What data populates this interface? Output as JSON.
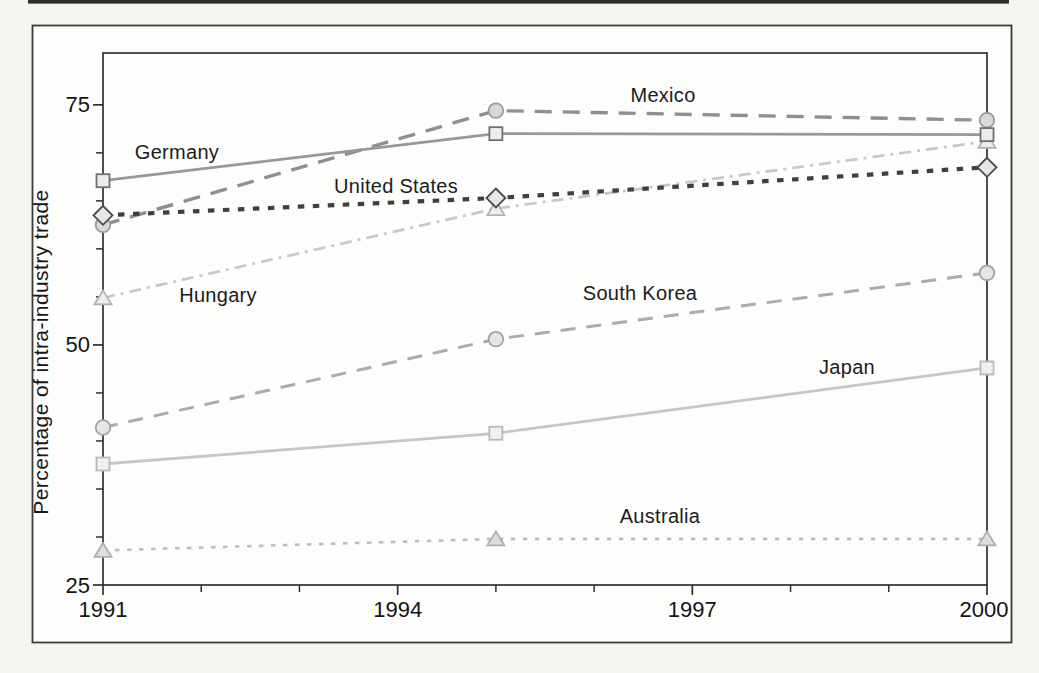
{
  "figure": {
    "page_background": "#f4f4f1",
    "paper_color": "#fdfdfc",
    "border_color": "#3b3b3b",
    "top_rule_color": "#2e2e2e"
  },
  "chart_data": {
    "type": "line",
    "title": "",
    "xlabel": "",
    "ylabel": "Percentage of intra-industry trade",
    "x": [
      1991,
      1995,
      2000
    ],
    "xlim": [
      1991,
      2000
    ],
    "ylim": [
      25,
      80.4
    ],
    "x_major_ticks": [
      1991,
      1994,
      1997,
      2000
    ],
    "x_minor_ticks": [
      1992,
      1993,
      1995,
      1996,
      1998,
      1999
    ],
    "y_major_ticks": [
      25,
      50,
      75
    ],
    "y_minor_ticks": [
      30,
      35,
      40,
      45,
      55,
      60,
      65,
      70
    ],
    "grid": false,
    "legend": "inline-series-labels",
    "series": [
      {
        "name": "Mexico",
        "values": [
          62.5,
          74.4,
          73.4
        ],
        "line": {
          "style": "dashed",
          "color": "#8f8f8f",
          "width": 3.4,
          "dash": "17 11"
        },
        "marker": {
          "shape": "circle",
          "fill": "#d9d9d9",
          "stroke": "#9a9a9a"
        },
        "label_pos": {
          "x": 663,
          "y": 102
        }
      },
      {
        "name": "Germany",
        "values": [
          67.1,
          72.0,
          71.9
        ],
        "line": {
          "style": "solid",
          "color": "#989898",
          "width": 2.8,
          "dash": ""
        },
        "marker": {
          "shape": "square",
          "fill": "#ececec",
          "stroke": "#6f6f6f"
        },
        "label_pos": {
          "x": 177,
          "y": 159
        }
      },
      {
        "name": "United States",
        "values": [
          63.5,
          65.3,
          68.5
        ],
        "line": {
          "style": "dotted",
          "color": "#3f3f3f",
          "width": 4.2,
          "dash": "6.5 8.5"
        },
        "marker": {
          "shape": "diamond",
          "fill": "#e7e7e7",
          "stroke": "#4a4a4a"
        },
        "label_pos": {
          "x": 396,
          "y": 193
        }
      },
      {
        "name": "Hungary",
        "values": [
          54.9,
          64.2,
          71.2
        ],
        "line": {
          "style": "dash-dot",
          "color": "#c8c8c8",
          "width": 2.7,
          "dash": "12 6 3 6"
        },
        "marker": {
          "shape": "triangle",
          "fill": "#ededed",
          "stroke": "#b2b2b2"
        },
        "label_pos": {
          "x": 218,
          "y": 302
        }
      },
      {
        "name": "South Korea",
        "values": [
          41.4,
          50.6,
          57.5
        ],
        "line": {
          "style": "dashed",
          "color": "#ababab",
          "width": 3.0,
          "dash": "15 11"
        },
        "marker": {
          "shape": "circle",
          "fill": "#e5e5e5",
          "stroke": "#a3a3a3"
        },
        "label_pos": {
          "x": 640,
          "y": 300
        }
      },
      {
        "name": "Japan",
        "values": [
          37.6,
          40.8,
          47.6
        ],
        "line": {
          "style": "solid",
          "color": "#c6c6c6",
          "width": 2.8,
          "dash": ""
        },
        "marker": {
          "shape": "square",
          "fill": "#f0f0f0",
          "stroke": "#b9b9b9"
        },
        "label_pos": {
          "x": 847,
          "y": 374
        }
      },
      {
        "name": "Australia",
        "values": [
          28.6,
          29.8,
          29.8
        ],
        "line": {
          "style": "dotted",
          "color": "#bdbdbd",
          "width": 2.6,
          "dash": "4.5 7.5"
        },
        "marker": {
          "shape": "triangle",
          "fill": "#dedede",
          "stroke": "#aeaeae"
        },
        "label_pos": {
          "x": 660,
          "y": 523
        }
      }
    ]
  }
}
